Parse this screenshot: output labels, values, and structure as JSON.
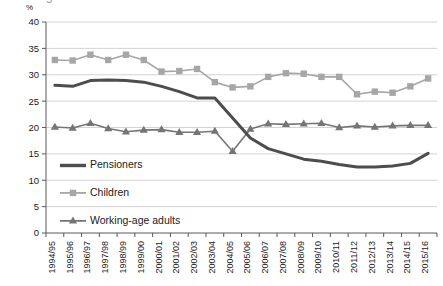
{
  "figure": {
    "clipped_title_fragment": "g    ",
    "y_unit_label": "%"
  },
  "legend": {
    "position": "inside-lower-left",
    "entries": [
      {
        "label": "Pensioners",
        "color": "#4d4d4d",
        "marker": "none"
      },
      {
        "label": "Children",
        "color": "#a6a6a6",
        "marker": "square"
      },
      {
        "label": "Working-age adults",
        "color": "#757575",
        "marker": "triangle"
      }
    ]
  },
  "chart_data": {
    "type": "line",
    "title": "",
    "xlabel": "",
    "ylabel": "%",
    "ylim": [
      0,
      40
    ],
    "ytick_step": 5,
    "yticks": [
      0,
      5,
      10,
      15,
      20,
      25,
      30,
      35,
      40
    ],
    "grid": true,
    "categories": [
      "1994/95",
      "1995/96",
      "1996/97",
      "1997/98",
      "1998/99",
      "1999/00",
      "2000/01",
      "2001/02",
      "2002/03",
      "2003/04",
      "2004/05",
      "2005/06",
      "2006/07",
      "2007/08",
      "2008/09",
      "2009/10",
      "2010/11",
      "2011/12",
      "2012/13",
      "2013/14",
      "2014/15",
      "2015/16"
    ],
    "series": [
      {
        "name": "Pensioners",
        "color": "#4d4d4d",
        "marker": "none",
        "line_width": 3,
        "values": [
          28.0,
          27.8,
          28.9,
          29.0,
          28.9,
          28.6,
          27.8,
          26.8,
          25.6,
          25.6,
          21.8,
          18.0,
          16.0,
          15.0,
          14.0,
          13.6,
          13.0,
          12.5,
          12.5,
          12.7,
          13.2,
          15.1
        ]
      },
      {
        "name": "Children",
        "color": "#a6a6a6",
        "marker": "square",
        "line_width": 1.6,
        "values": [
          32.8,
          32.7,
          33.8,
          32.8,
          33.8,
          32.8,
          30.6,
          30.7,
          31.1,
          28.6,
          27.6,
          27.8,
          29.6,
          30.3,
          30.2,
          29.6,
          29.6,
          26.3,
          26.8,
          26.6,
          27.8,
          29.3
        ]
      },
      {
        "name": "Working-age adults",
        "color": "#757575",
        "marker": "triangle",
        "line_width": 1.6,
        "values": [
          20.1,
          19.9,
          20.8,
          19.8,
          19.2,
          19.5,
          19.6,
          19.1,
          19.1,
          19.3,
          15.5,
          19.7,
          20.7,
          20.6,
          20.7,
          20.8,
          20.0,
          20.3,
          20.1,
          20.3,
          20.4,
          20.4
        ]
      }
    ]
  },
  "plot_geometry": {
    "left": 46,
    "right": 437,
    "top": 22,
    "bottom": 233
  }
}
